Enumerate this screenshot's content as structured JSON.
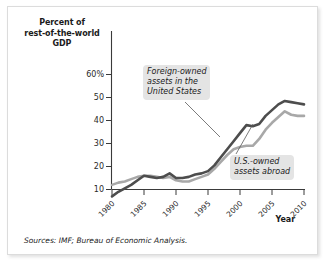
{
  "figure": {
    "sources_note": "Sources: IMF; Bureau of Economic Analysis.",
    "colors": {
      "foreign_line": "#4d4d4d",
      "us_line": "#a8a8a8",
      "axis": "#3a3a3a",
      "callout_bg": "#e4e4e4",
      "card_border": "#dcdcdc"
    }
  },
  "chart_data": {
    "type": "line",
    "title": "",
    "ylabel": "Percent of\nrest-of-the-world\nGDP",
    "xlabel": "Year",
    "ylim": [
      0,
      65
    ],
    "xlim": [
      1980,
      2010
    ],
    "yticks": [
      10,
      20,
      30,
      40,
      50,
      60
    ],
    "ytick_labels": [
      "10",
      "20",
      "30",
      "40",
      "50",
      "60%"
    ],
    "xticks": [
      1980,
      1985,
      1990,
      1995,
      2000,
      2005,
      2010
    ],
    "xtick_labels": [
      "1980",
      "1985",
      "1990",
      "1995",
      "2000",
      "2005",
      "2010"
    ],
    "grid": false,
    "legend": "annotations",
    "annotations": [
      {
        "name": "foreign-owned-label",
        "text": "Foreign-owned\nassets in the\nUnited States",
        "points_to_series": "Foreign-owned assets in the United States"
      },
      {
        "name": "us-owned-label",
        "text": "U.S.-owned\nassets abroad",
        "points_to_series": "U.S.-owned assets abroad"
      }
    ],
    "x": [
      1980,
      1981,
      1982,
      1983,
      1984,
      1985,
      1986,
      1987,
      1988,
      1989,
      1990,
      1991,
      1992,
      1993,
      1994,
      1995,
      1996,
      1997,
      1998,
      1999,
      2000,
      2001,
      2002,
      2003,
      2004,
      2005,
      2006,
      2007,
      2008,
      2009,
      2010
    ],
    "series": [
      {
        "name": "Foreign-owned assets in the United States",
        "color": "#4d4d4d",
        "values": [
          7,
          9,
          10.5,
          12,
          14,
          16,
          15.5,
          15,
          15.5,
          17,
          15,
          15,
          15.5,
          16.5,
          17,
          18,
          20.5,
          24,
          27.5,
          31,
          34.5,
          38,
          37.5,
          38.5,
          42,
          44.5,
          47,
          48.5,
          48,
          47.5,
          47
        ]
      },
      {
        "name": "U.S.-owned assets abroad",
        "color": "#a8a8a8",
        "values": [
          12,
          13,
          13.5,
          14.5,
          15.5,
          16,
          16,
          15.5,
          15,
          15.5,
          14,
          13.5,
          13.5,
          14.5,
          15.5,
          16.5,
          19,
          22,
          25,
          27.5,
          28.5,
          29,
          29,
          32,
          36,
          39,
          41.5,
          44,
          42.5,
          42,
          42
        ]
      }
    ]
  }
}
